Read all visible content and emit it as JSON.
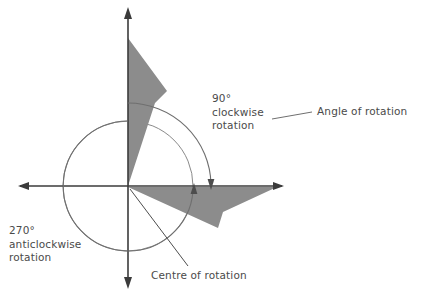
{
  "figure": {
    "background_color": "#ffffff",
    "shape_fill_color": "#8c8c8c",
    "axis_color": "#3b3b3b",
    "arc_color": "#6f6f6f",
    "circle_color": "#8a8a8a",
    "text_color": "#4a4a4a"
  },
  "labels": {
    "clockwise": "90°\nclockwise\nrotation",
    "anticlockwise": "270°\nanticlockwise\nrotation",
    "angle_of_rotation": "Angle of rotation",
    "centre_of_rotation": "Centre of rotation"
  },
  "chart_data": {
    "type": "diagram",
    "origin": {
      "x": 128,
      "y": 186,
      "name": "centre of rotation"
    },
    "axes": {
      "x_axis": {
        "from": [
          18,
          186
        ],
        "to": [
          284,
          186
        ],
        "arrows": "both"
      },
      "y_axis": {
        "from": [
          128,
          8
        ],
        "to": [
          128,
          288
        ],
        "arrows": "both"
      }
    },
    "guide_circle": {
      "cx": 128,
      "cy": 186,
      "r": 65
    },
    "shapes": [
      {
        "name": "object-shape",
        "position": "upper quadrant, left edge on positive y-axis",
        "fill": "#8c8c8c",
        "points": [
          [
            128,
            186
          ],
          [
            128,
            38
          ],
          [
            167,
            91
          ],
          [
            155,
            103
          ]
        ]
      },
      {
        "name": "image-shape",
        "position": "lower right quadrant, top edge on positive x-axis",
        "fill": "#8c8c8c",
        "points": [
          [
            128,
            187
          ],
          [
            277,
            187
          ],
          [
            223,
            212
          ],
          [
            218,
            228
          ]
        ]
      }
    ],
    "arcs": [
      {
        "name": "clockwise-90-arc",
        "degrees": 90,
        "direction": "clockwise",
        "from_angle_deg": 90,
        "to_angle_deg": 0,
        "radius": 83,
        "arrowhead_at": [
          211,
          186
        ],
        "arrowhead_direction": "down"
      },
      {
        "name": "anticlockwise-270-arc",
        "degrees": 270,
        "direction": "anticlockwise",
        "from_angle_deg": 90,
        "to_angle_deg": -360,
        "radius": 65,
        "arrowhead_at": [
          194,
          188
        ],
        "arrowhead_direction": "up"
      }
    ],
    "leader_lines": [
      {
        "name": "angle-leader",
        "from": [
          310,
          112
        ],
        "to": [
          272,
          120
        ]
      },
      {
        "name": "centre-leader",
        "from": [
          186,
          266
        ],
        "to": [
          130,
          189
        ]
      }
    ],
    "annotations": [
      {
        "text": "90° clockwise rotation",
        "at": [
          212,
          92
        ]
      },
      {
        "text": "270° anticlockwise rotation",
        "at": [
          9,
          224
        ]
      },
      {
        "text": "Angle of rotation",
        "at": [
          317,
          105
        ]
      },
      {
        "text": "Centre of rotation",
        "at": [
          151,
          269
        ]
      }
    ]
  }
}
